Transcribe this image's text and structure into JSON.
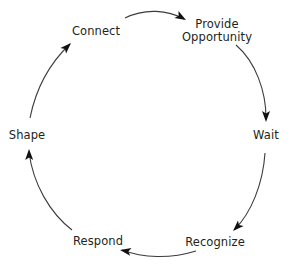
{
  "diagram": {
    "type": "cycle",
    "direction": "clockwise",
    "background_color": "#ffffff",
    "stroke_color": "#3b3b3b",
    "text_color": "#231f20",
    "center": {
      "x": 147,
      "y": 137
    },
    "radius": 118,
    "nodes": [
      {
        "id": "connect",
        "label": "Connect",
        "label2": "",
        "x": 96,
        "y": 31,
        "angle_deg": 118
      },
      {
        "id": "provide-opportunity",
        "label": "Provide",
        "label2": "Opportunity",
        "x": 217,
        "y": 31,
        "angle_deg": 60
      },
      {
        "id": "wait",
        "label": "Wait",
        "label2": "",
        "x": 266,
        "y": 135,
        "angle_deg": 0
      },
      {
        "id": "recognize",
        "label": "Recognize",
        "label2": "",
        "x": 215,
        "y": 242,
        "angle_deg": -58
      },
      {
        "id": "respond",
        "label": "Respond",
        "label2": "",
        "x": 98,
        "y": 241,
        "angle_deg": -120
      },
      {
        "id": "shape",
        "label": "Shape",
        "label2": "",
        "x": 27,
        "y": 135,
        "angle_deg": 180
      }
    ],
    "edges": [
      {
        "id": "connect-to-provide",
        "from": "connect",
        "to": "provide-opportunity",
        "path": "M 125 18 C 145 8 168 10 184 19"
      },
      {
        "id": "provide-to-wait",
        "from": "provide-opportunity",
        "to": "wait",
        "path": "M 236 45 C 256 62 266 92 266 118"
      },
      {
        "id": "wait-to-recognize",
        "from": "wait",
        "to": "recognize",
        "path": "M 265 153 C 263 184 251 213 235 229"
      },
      {
        "id": "recognize-to-respond",
        "from": "recognize",
        "to": "respond",
        "path": "M 196 251 C 170 259 143 258 122 250"
      },
      {
        "id": "respond-to-shape",
        "from": "respond",
        "to": "shape",
        "path": "M 72 230 C 50 213 33 184 29 152"
      },
      {
        "id": "shape-to-connect",
        "from": "shape",
        "to": "connect",
        "path": "M 30 118 C 36 88 51 62 70 44"
      }
    ],
    "arrowheads": [
      {
        "id": "arrow-into-provide-opportunity",
        "x": 186,
        "y": 20,
        "rotation_deg": 30
      },
      {
        "id": "arrow-into-wait",
        "x": 266,
        "y": 122,
        "rotation_deg": 90
      },
      {
        "id": "arrow-into-recognize",
        "x": 233,
        "y": 231,
        "rotation_deg": 135
      },
      {
        "id": "arrow-into-respond",
        "x": 120,
        "y": 250,
        "rotation_deg": 190
      },
      {
        "id": "arrow-into-shape",
        "x": 29,
        "y": 149,
        "rotation_deg": 269
      },
      {
        "id": "arrow-into-connect",
        "x": 71,
        "y": 43,
        "rotation_deg": 315
      }
    ]
  }
}
